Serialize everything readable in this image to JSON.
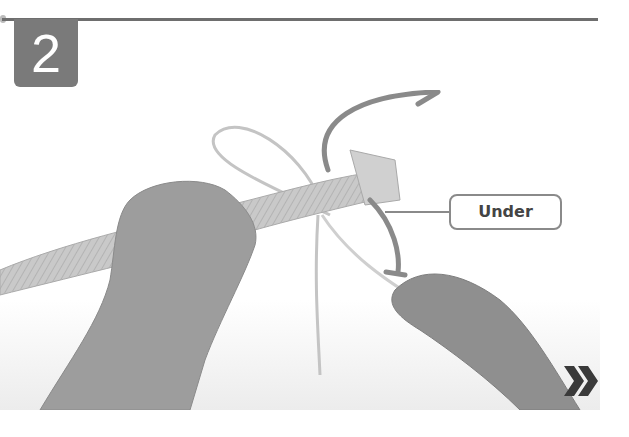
{
  "step": {
    "number": "2"
  },
  "illustration": {
    "subject": "hands-tying-rope-knot",
    "callout_label": "Under",
    "arrows": [
      "curved-arrow-up-right",
      "curved-arrow-down"
    ]
  },
  "navigation": {
    "next_icon": "double-chevron-right-icon"
  },
  "colors": {
    "rule": "#6e6e6e",
    "badge_bg": "#7a7a7a",
    "badge_text": "#ffffff",
    "arrow": "#8a8a8a",
    "callout_border": "#8a8a8a",
    "callout_text": "#444444",
    "next_icon": "#3a3a3a"
  }
}
